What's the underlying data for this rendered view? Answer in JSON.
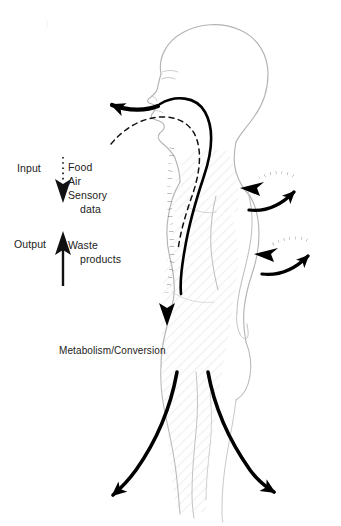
{
  "diagram": {
    "background_color": "#ffffff",
    "outline_color": "#b0b0b0",
    "arrow_color": "#000000",
    "text_color": "#222222",
    "hatch_color": "#f0eff0"
  },
  "labels": {
    "input": "Input",
    "output": "Output",
    "intake_line_1": "Food",
    "intake_line_2": "Air",
    "intake_line_3": "Sensory",
    "intake_line_4": "data",
    "waste_line_1": "Waste",
    "waste_line_2": "products",
    "metabolism": "Metabolism/Conversion"
  },
  "arrows": {
    "input_arrow": {
      "name": "input-dotted-down-arrow",
      "style": "dotted",
      "direction": "down"
    },
    "output_arrow": {
      "name": "output-solid-up-arrow",
      "style": "solid",
      "direction": "up"
    },
    "mouth_arrow": {
      "name": "mouth-exhale-arrow",
      "style": "solid",
      "direction": "left"
    },
    "ingestion_path": {
      "name": "ingestion-solid-path",
      "style": "solid",
      "direction": "down"
    },
    "airway_path": {
      "name": "airway-dashed-path",
      "style": "dashed",
      "direction": "down"
    },
    "digestive_path": {
      "name": "digestive-dotted-path",
      "style": "dotted-thick",
      "direction": "down"
    },
    "exchange_upper_in": {
      "name": "upper-exchange-dotted-inbound-arrow",
      "style": "dotted",
      "direction": "left"
    },
    "exchange_upper_out": {
      "name": "upper-exchange-solid-outbound-arrow",
      "style": "solid",
      "direction": "up-right"
    },
    "exchange_lower_in": {
      "name": "lower-exchange-dotted-inbound-arrow",
      "style": "dotted",
      "direction": "left"
    },
    "exchange_lower_out": {
      "name": "lower-exchange-solid-outbound-arrow",
      "style": "solid",
      "direction": "up-right"
    },
    "leg_left_arrow": {
      "name": "left-leg-output-arrow",
      "style": "solid",
      "direction": "down-left"
    },
    "leg_right_arrow": {
      "name": "right-leg-output-arrow",
      "style": "solid",
      "direction": "down-right"
    }
  }
}
